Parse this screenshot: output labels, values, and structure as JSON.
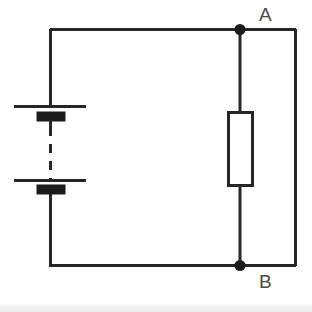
{
  "diagram": {
    "kind": "electrical-circuit-schematic",
    "title": "",
    "background_color": "#ffffff",
    "stroke_color": "#262626",
    "label_color": "#4a4a4a",
    "canvas": {
      "width": 312,
      "height": 312
    },
    "labels": {
      "node_a": "A",
      "node_b": "B"
    },
    "nodes": [
      {
        "name": "node-a",
        "label": "A",
        "x": 240,
        "y": 29,
        "radius": 5,
        "filled": true
      },
      {
        "name": "node-b",
        "label": "B",
        "x": 240,
        "y": 266,
        "radius": 5,
        "filled": true
      }
    ],
    "components": [
      {
        "name": "battery",
        "type": "battery-multicell",
        "orientation": "vertical",
        "x": 50,
        "cells": [
          {
            "long_plate_y": 106,
            "short_plate_y": 117
          },
          {
            "long_plate_y": 180,
            "short_plate_y": 190
          }
        ],
        "dashed_gap": {
          "from_y": 126,
          "to_y": 179
        }
      },
      {
        "name": "resistor",
        "type": "resistor-box",
        "orientation": "vertical",
        "box": {
          "x": 228,
          "y": 112,
          "width": 24,
          "height": 74
        }
      }
    ],
    "wires": [
      {
        "name": "top-wire-left",
        "x1": 50,
        "y1": 29,
        "x2": 240,
        "y2": 29
      },
      {
        "name": "top-wire-right",
        "x1": 240,
        "y1": 29,
        "x2": 296,
        "y2": 29
      },
      {
        "name": "left-rail-upper",
        "x1": 50,
        "y1": 29,
        "x2": 50,
        "y2": 106
      },
      {
        "name": "left-rail-lower",
        "x1": 50,
        "y1": 190,
        "x2": 50,
        "y2": 266
      },
      {
        "name": "bottom-wire-left",
        "x1": 50,
        "y1": 266,
        "x2": 240,
        "y2": 266
      },
      {
        "name": "bottom-wire-right",
        "x1": 240,
        "y1": 266,
        "x2": 296,
        "y2": 266
      },
      {
        "name": "right-rail",
        "x1": 296,
        "y1": 29,
        "x2": 296,
        "y2": 266
      },
      {
        "name": "resistor-lead-top",
        "x1": 240,
        "y1": 29,
        "x2": 240,
        "y2": 112
      },
      {
        "name": "resistor-lead-bottom",
        "x1": 240,
        "y1": 186,
        "x2": 240,
        "y2": 266
      }
    ],
    "footer_band": {
      "color": "#ededed",
      "top": 303,
      "height": 9
    }
  }
}
